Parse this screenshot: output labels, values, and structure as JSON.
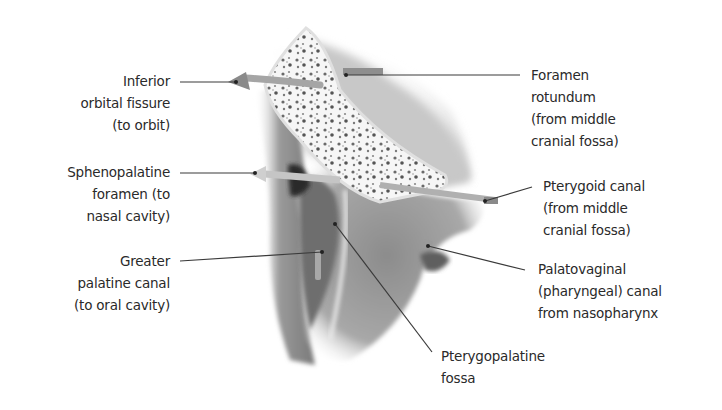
{
  "diagram": {
    "labels": [
      {
        "id": "inferior-orbital-fissure",
        "text": "Inferior\norbital fissure\n(to orbit)",
        "side": "left"
      },
      {
        "id": "sphenopalatine-foramen",
        "text": "Sphenopalatine\nforamen (to\nnasal cavity)",
        "side": "left"
      },
      {
        "id": "greater-palatine-canal",
        "text": "Greater\npalatine canal\n(to oral cavity)",
        "side": "left"
      },
      {
        "id": "foramen-rotundum",
        "text": "Foramen\nrotundum\n(from middle\ncranial fossa)",
        "side": "right"
      },
      {
        "id": "pterygoid-canal",
        "text": "Pterygoid canal\n(from middle\ncranial fossa)",
        "side": "right"
      },
      {
        "id": "palatovaginal-canal",
        "text": "Palatovaginal\n(pharyngeal) canal\nfrom nasopharynx",
        "side": "right"
      },
      {
        "id": "pterygopalatine-fossa",
        "text": "Pterygopalatine\nfossa",
        "side": "bottom"
      }
    ],
    "colors": {
      "leader_line": "#3a3a3a",
      "bone_fill": "#f4f4f4",
      "tissue_shade": "#8a8a8a",
      "arrow_fill": "#9a9a9a"
    }
  }
}
